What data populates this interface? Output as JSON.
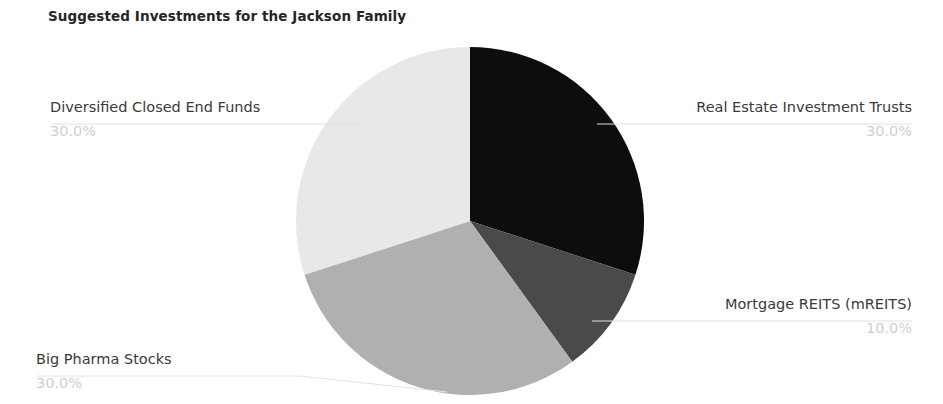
{
  "chart": {
    "title": "Suggested Investments for the Jackson Family"
  },
  "chart_data": {
    "type": "pie",
    "title": "Suggested Investments for the Jackson Family",
    "xlabel": "",
    "ylabel": "",
    "legend": "none (direct labels with leader lines)",
    "grid": false,
    "start_angle_deg": 90,
    "direction": "clockwise",
    "categories": [
      "Real Estate Investment Trusts",
      "Mortgage REITS (mREITS)",
      "Big Pharma Stocks",
      "Diversified Closed End Funds"
    ],
    "values": [
      30.0,
      10.0,
      30.0,
      30.0
    ],
    "value_labels": [
      "30.0%",
      "10.0%",
      "30.0%",
      "30.0%"
    ],
    "colors": [
      "#0d0d0d",
      "#4a4a4a",
      "#b0b0b0",
      "#e8e8e8"
    ],
    "slices": [
      {
        "label": "Real Estate Investment Trusts",
        "percent_label": "30.0%",
        "value": 30.0,
        "color": "#0d0d0d"
      },
      {
        "label": "Mortgage REITS (mREITS)",
        "percent_label": "10.0%",
        "value": 10.0,
        "color": "#4a4a4a"
      },
      {
        "label": "Big Pharma Stocks",
        "percent_label": "30.0%",
        "value": 30.0,
        "color": "#b0b0b0"
      },
      {
        "label": "Diversified Closed End Funds",
        "percent_label": "30.0%",
        "value": 30.0,
        "color": "#e8e8e8"
      }
    ],
    "leader_line_color": "#e2e2e2",
    "percent_text_color": "#cfcfcf",
    "label_text_color": "#3a3a3a",
    "background": "#ffffff"
  }
}
